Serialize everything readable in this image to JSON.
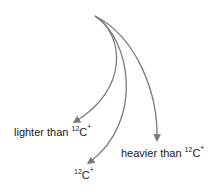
{
  "diagram": {
    "stroke_color": "#7a7a7a",
    "trajectories": [
      {
        "id": "lighter",
        "path": "M95,16 C125,35 128,90 76,121",
        "label_prefix": "lighter than ",
        "mass": "12",
        "element": "C",
        "charge": "+"
      },
      {
        "id": "equal",
        "path": "M95,16 C130,38 145,120 90,162",
        "label_prefix": "",
        "mass": "12",
        "element": "C",
        "charge": "+"
      },
      {
        "id": "heavier",
        "path": "M95,16 C138,38 158,95 157,138",
        "label_prefix": "heavier than ",
        "mass": "12",
        "element": "C",
        "charge": "+"
      }
    ]
  }
}
